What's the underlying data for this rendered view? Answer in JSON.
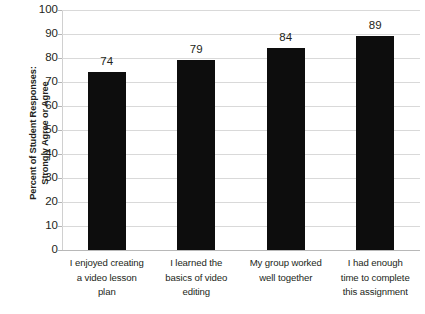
{
  "chart_data": {
    "type": "bar",
    "title": "",
    "subtitle": "",
    "xlabel": "",
    "ylabel": "Percent of Student Responses: Strongly Agree or Agree",
    "ylabel_lines": [
      "Percent of Student Responses:",
      "Strongly Agree or Agree"
    ],
    "categories": [
      "I enjoyed creating a video lesson plan",
      "I learned the basics of video editing",
      "My group worked well together",
      "I had enough time to complete this assignment"
    ],
    "category_lines": [
      [
        "I enjoyed creating",
        "a video lesson",
        "plan"
      ],
      [
        "I learned the",
        "basics of video",
        "editing"
      ],
      [
        "My group worked",
        "well together"
      ],
      [
        "I had enough",
        "time to complete",
        "this assignment"
      ]
    ],
    "values": [
      74,
      79,
      84,
      89
    ],
    "value_labels": [
      "74",
      "79",
      "84",
      "89"
    ],
    "ylim": [
      0,
      100
    ],
    "ytick_step": 10,
    "ytick_labels": [
      "0",
      "10",
      "20",
      "30",
      "40",
      "50",
      "60",
      "70",
      "80",
      "90",
      "100"
    ],
    "grid": true,
    "grid_axis": "y",
    "legend": false,
    "legend_position": "none",
    "bar_color": "#0d0d0d",
    "grid_color": "#d9d9d9",
    "text_color": "#231f20",
    "background_color": "#ffffff"
  }
}
